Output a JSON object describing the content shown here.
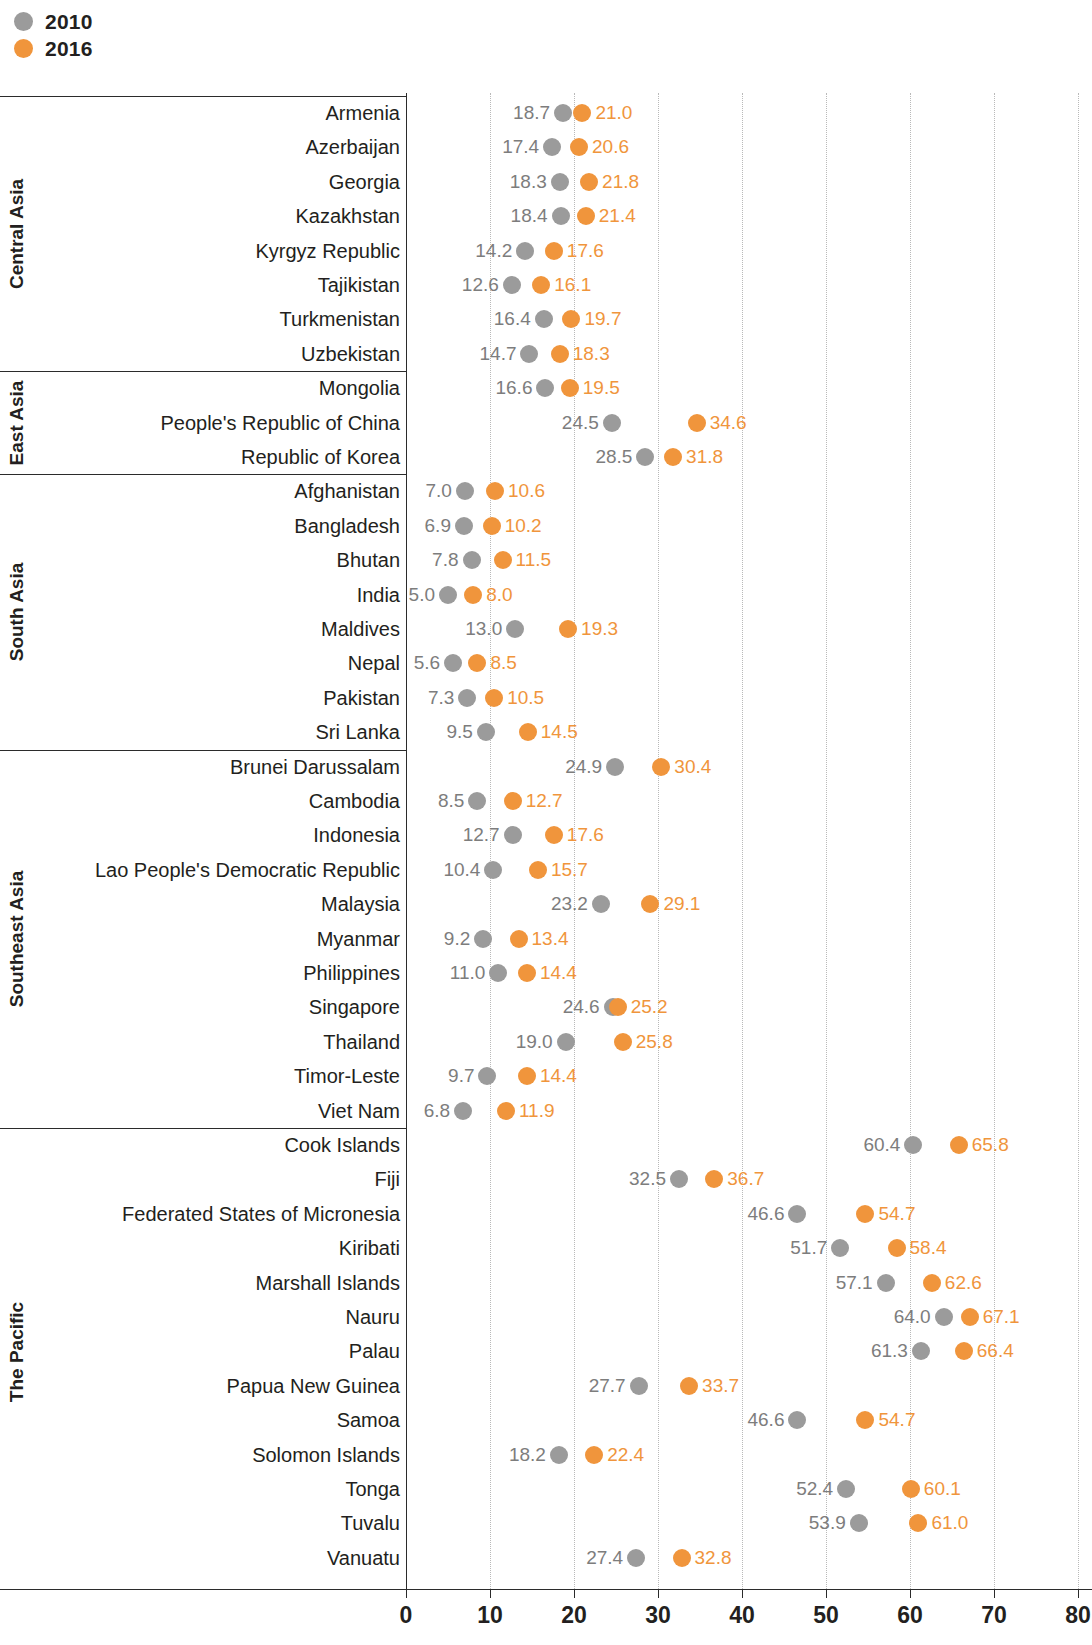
{
  "legend": {
    "items": [
      {
        "label": "2010",
        "color": "#9b9b9b",
        "icon": "circle-marker-icon"
      },
      {
        "label": "2016",
        "color": "#f0953c",
        "icon": "circle-marker-icon"
      }
    ]
  },
  "axis": {
    "ticks": [
      "0",
      "10",
      "20",
      "30",
      "40",
      "50",
      "60",
      "70",
      "80"
    ]
  },
  "groups": [
    {
      "label": "Central Asia"
    },
    {
      "label": "East Asia"
    },
    {
      "label": "South Asia"
    },
    {
      "label": "Southeast Asia"
    },
    {
      "label": "The Pacific"
    }
  ],
  "chart_data": {
    "type": "scatter",
    "title": "",
    "subtitle": "",
    "xlabel": "",
    "ylabel": "",
    "xlim": [
      0,
      80
    ],
    "xticks": [
      0,
      10,
      20,
      30,
      40,
      50,
      60,
      70,
      80
    ],
    "grid": "vertical-dotted",
    "legend_position": "top-left",
    "series": [
      {
        "name": "2010",
        "color": "#9b9b9b"
      },
      {
        "name": "2016",
        "color": "#f0953c"
      }
    ],
    "groups": [
      {
        "name": "Central Asia",
        "rows": [
          {
            "category": "Armenia",
            "v2010": 18.7,
            "v2016": 21.0
          },
          {
            "category": "Azerbaijan",
            "v2010": 17.4,
            "v2016": 20.6
          },
          {
            "category": "Georgia",
            "v2010": 18.3,
            "v2016": 21.8
          },
          {
            "category": "Kazakhstan",
            "v2010": 18.4,
            "v2016": 21.4
          },
          {
            "category": "Kyrgyz Republic",
            "v2010": 14.2,
            "v2016": 17.6
          },
          {
            "category": "Tajikistan",
            "v2010": 12.6,
            "v2016": 16.1
          },
          {
            "category": "Turkmenistan",
            "v2010": 16.4,
            "v2016": 19.7
          },
          {
            "category": "Uzbekistan",
            "v2010": 14.7,
            "v2016": 18.3
          }
        ]
      },
      {
        "name": "East Asia",
        "rows": [
          {
            "category": "Mongolia",
            "v2010": 16.6,
            "v2016": 19.5
          },
          {
            "category": "People's Republic of China",
            "v2010": 24.5,
            "v2016": 34.6
          },
          {
            "category": "Republic of Korea",
            "v2010": 28.5,
            "v2016": 31.8
          }
        ]
      },
      {
        "name": "South Asia",
        "rows": [
          {
            "category": "Afghanistan",
            "v2010": 7.0,
            "v2016": 10.6
          },
          {
            "category": "Bangladesh",
            "v2010": 6.9,
            "v2016": 10.2
          },
          {
            "category": "Bhutan",
            "v2010": 7.8,
            "v2016": 11.5
          },
          {
            "category": "India",
            "v2010": 5.0,
            "v2016": 8.0
          },
          {
            "category": "Maldives",
            "v2010": 13.0,
            "v2016": 19.3
          },
          {
            "category": "Nepal",
            "v2010": 5.6,
            "v2016": 8.5
          },
          {
            "category": "Pakistan",
            "v2010": 7.3,
            "v2016": 10.5
          },
          {
            "category": "Sri Lanka",
            "v2010": 9.5,
            "v2016": 14.5
          }
        ]
      },
      {
        "name": "Southeast Asia",
        "rows": [
          {
            "category": "Brunei Darussalam",
            "v2010": 24.9,
            "v2016": 30.4
          },
          {
            "category": "Cambodia",
            "v2010": 8.5,
            "v2016": 12.7
          },
          {
            "category": "Indonesia",
            "v2010": 12.7,
            "v2016": 17.6
          },
          {
            "category": "Lao People's Democratic Republic",
            "v2010": 10.4,
            "v2016": 15.7
          },
          {
            "category": "Malaysia",
            "v2010": 23.2,
            "v2016": 29.1
          },
          {
            "category": "Myanmar",
            "v2010": 9.2,
            "v2016": 13.4
          },
          {
            "category": "Philippines",
            "v2010": 11.0,
            "v2016": 14.4
          },
          {
            "category": "Singapore",
            "v2010": 24.6,
            "v2016": 25.2
          },
          {
            "category": "Thailand",
            "v2010": 19.0,
            "v2016": 25.8
          },
          {
            "category": "Timor-Leste",
            "v2010": 9.7,
            "v2016": 14.4
          },
          {
            "category": "Viet Nam",
            "v2010": 6.8,
            "v2016": 11.9
          }
        ]
      },
      {
        "name": "The Pacific",
        "rows": [
          {
            "category": "Cook Islands",
            "v2010": 60.4,
            "v2016": 65.8
          },
          {
            "category": "Fiji",
            "v2010": 32.5,
            "v2016": 36.7
          },
          {
            "category": "Federated States of Micronesia",
            "v2010": 46.6,
            "v2016": 54.7
          },
          {
            "category": "Kiribati",
            "v2010": 51.7,
            "v2016": 58.4
          },
          {
            "category": "Marshall Islands",
            "v2010": 57.1,
            "v2016": 62.6
          },
          {
            "category": "Nauru",
            "v2010": 64.0,
            "v2016": 67.1
          },
          {
            "category": "Palau",
            "v2010": 61.3,
            "v2016": 66.4
          },
          {
            "category": "Papua New Guinea",
            "v2010": 27.7,
            "v2016": 33.7
          },
          {
            "category": "Samoa",
            "v2010": 46.6,
            "v2016": 54.7
          },
          {
            "category": "Solomon Islands",
            "v2010": 18.2,
            "v2016": 22.4
          },
          {
            "category": "Tonga",
            "v2010": 52.4,
            "v2016": 60.1
          },
          {
            "category": "Tuvalu",
            "v2010": 53.9,
            "v2016": 61.0
          },
          {
            "category": "Vanuatu",
            "v2010": 27.4,
            "v2016": 32.8
          }
        ]
      }
    ]
  }
}
